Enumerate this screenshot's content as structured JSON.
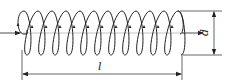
{
  "diagram": {
    "type": "solenoid-coil",
    "turns": 12,
    "labels": {
      "length": "l",
      "diameter": "d"
    },
    "colors": {
      "stroke": "#222222",
      "background": "#ffffff"
    }
  }
}
